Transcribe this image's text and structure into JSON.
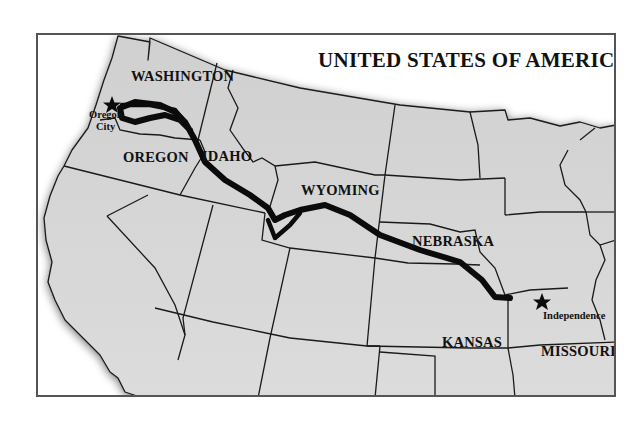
{
  "map": {
    "title": "UNITED STATES OF AMERICA",
    "colors": {
      "land": "#d8d8d8",
      "land_edge_shadow": "#555555",
      "border_lines": "#1a1a1a",
      "trail": "#0b0b0b",
      "frame": "#555555",
      "background": "#ffffff"
    },
    "states": {
      "washington": "WASHINGTON",
      "oregon": "OREGON",
      "idaho": "IDAHO",
      "wyoming": "WYOMING",
      "nebraska": "NEBRASKA",
      "kansas": "KANSAS",
      "missouri": "MISSOURI"
    },
    "cities": {
      "start_line1": "Oregon",
      "start_line2": "City",
      "end": "Independence"
    },
    "markers": {
      "start_icon": "star-icon",
      "end_icon": "star-icon"
    },
    "route": {
      "name_icon": "trail-line",
      "from": "Independence",
      "to": "Oregon City"
    }
  }
}
